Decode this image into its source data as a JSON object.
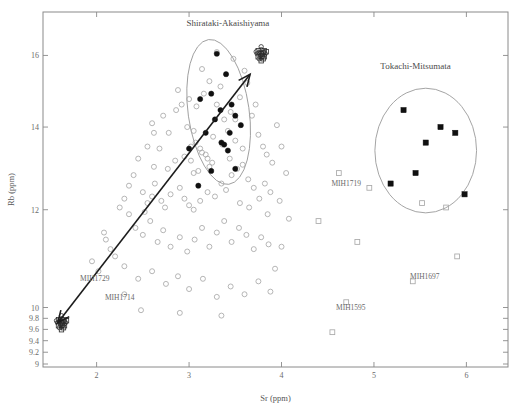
{
  "chart_data": {
    "type": "scatter",
    "title": "",
    "xlabel": "Sr (ppm)",
    "ylabel": "Rb (ppm)",
    "xlim": [
      1.42,
      6.45
    ],
    "ylim": [
      8.95,
      17.35
    ],
    "xticks": [
      "2",
      "3",
      "4",
      "5",
      "6"
    ],
    "xtick_values": [
      2,
      3,
      4,
      5,
      6
    ],
    "yticks": [
      "16",
      "14",
      "12",
      "10",
      "9.8",
      "9.6",
      "9.4",
      "9.2",
      "9"
    ],
    "ytick_values": [
      16,
      14,
      12,
      10,
      9.8,
      9.6,
      9.4,
      9.2,
      9
    ],
    "y_scale": "log",
    "grid": false,
    "legend": false,
    "annotations": [
      {
        "text": "Shirataki-Akaishiyama",
        "x": 3.42,
        "y": 16.9
      },
      {
        "text": "Tokachi-Mitsumata",
        "x": 5.45,
        "y": 15.6
      },
      {
        "text": "MIH1719",
        "x": 4.7,
        "y": 12.55
      },
      {
        "text": "MIH1697",
        "x": 5.55,
        "y": 10.55
      },
      {
        "text": "MIH1595",
        "x": 4.75,
        "y": 9.95
      },
      {
        "text": "MIH1729",
        "x": 1.98,
        "y": 10.5
      },
      {
        "text": "MIH1714",
        "x": 2.25,
        "y": 10.15
      }
    ],
    "series": [
      {
        "name": "open-circles",
        "marker": "open-circle",
        "color": "#a9a9a9",
        "points": [
          [
            2.62,
            13.85
          ],
          [
            2.78,
            13.85
          ],
          [
            2.77,
            12.95
          ],
          [
            2.62,
            13.0
          ],
          [
            2.63,
            12.6
          ],
          [
            2.98,
            14.0
          ],
          [
            3.02,
            13.5
          ],
          [
            3.07,
            13.6
          ],
          [
            3.12,
            13.45
          ],
          [
            3.14,
            13.35
          ],
          [
            3.18,
            13.3
          ],
          [
            3.2,
            13.2
          ],
          [
            3.05,
            12.85
          ],
          [
            3.1,
            12.9
          ],
          [
            3.22,
            13.0
          ],
          [
            3.25,
            13.1
          ],
          [
            2.86,
            14.45
          ],
          [
            2.92,
            14.6
          ],
          [
            2.88,
            15.0
          ],
          [
            3.0,
            14.75
          ],
          [
            3.08,
            14.55
          ],
          [
            3.16,
            14.9
          ],
          [
            3.22,
            15.25
          ],
          [
            3.3,
            14.6
          ],
          [
            3.34,
            15.1
          ],
          [
            3.38,
            14.2
          ],
          [
            3.45,
            14.4
          ],
          [
            3.5,
            14.2
          ],
          [
            3.55,
            14.8
          ],
          [
            3.6,
            15.55
          ],
          [
            3.63,
            15.2
          ],
          [
            3.68,
            14.3
          ],
          [
            3.72,
            14.6
          ],
          [
            3.75,
            13.8
          ],
          [
            3.8,
            13.5
          ],
          [
            3.84,
            13.3
          ],
          [
            3.9,
            13.1
          ],
          [
            2.5,
            12.4
          ],
          [
            2.55,
            12.15
          ],
          [
            2.6,
            12.3
          ],
          [
            2.7,
            12.2
          ],
          [
            2.74,
            12.05
          ],
          [
            2.8,
            12.35
          ],
          [
            2.9,
            12.5
          ],
          [
            2.95,
            12.25
          ],
          [
            3.0,
            12.1
          ],
          [
            3.05,
            12.0
          ],
          [
            3.12,
            12.2
          ],
          [
            3.2,
            12.4
          ],
          [
            3.28,
            12.3
          ],
          [
            3.35,
            12.6
          ],
          [
            3.4,
            12.45
          ],
          [
            3.46,
            12.8
          ],
          [
            3.52,
            12.95
          ],
          [
            3.58,
            13.05
          ],
          [
            3.64,
            12.7
          ],
          [
            3.7,
            12.5
          ],
          [
            3.76,
            12.25
          ],
          [
            3.82,
            12.6
          ],
          [
            3.88,
            12.4
          ],
          [
            2.35,
            11.9
          ],
          [
            2.42,
            11.6
          ],
          [
            2.5,
            11.45
          ],
          [
            2.58,
            11.75
          ],
          [
            2.66,
            11.3
          ],
          [
            2.72,
            11.55
          ],
          [
            2.8,
            11.2
          ],
          [
            2.9,
            11.4
          ],
          [
            2.98,
            11.1
          ],
          [
            3.06,
            11.35
          ],
          [
            3.14,
            11.6
          ],
          [
            3.22,
            11.2
          ],
          [
            3.3,
            11.5
          ],
          [
            3.38,
            11.75
          ],
          [
            3.46,
            11.3
          ],
          [
            3.54,
            11.6
          ],
          [
            3.62,
            11.45
          ],
          [
            3.7,
            11.15
          ],
          [
            3.78,
            11.4
          ],
          [
            3.86,
            11.25
          ],
          [
            2.2,
            11.0
          ],
          [
            2.3,
            10.8
          ],
          [
            2.45,
            10.55
          ],
          [
            2.6,
            10.7
          ],
          [
            2.75,
            10.45
          ],
          [
            2.88,
            10.6
          ],
          [
            3.0,
            10.35
          ],
          [
            3.15,
            10.55
          ],
          [
            3.3,
            10.2
          ],
          [
            3.45,
            10.4
          ],
          [
            3.6,
            10.25
          ],
          [
            3.75,
            10.5
          ],
          [
            3.88,
            10.3
          ],
          [
            2.1,
            11.35
          ],
          [
            2.15,
            11.15
          ],
          [
            1.95,
            10.9
          ],
          [
            2.02,
            10.7
          ],
          [
            2.08,
            11.5
          ],
          [
            2.25,
            12.05
          ],
          [
            2.3,
            12.25
          ],
          [
            3.95,
            14.05
          ],
          [
            4.0,
            13.5
          ],
          [
            4.05,
            12.85
          ],
          [
            3.98,
            12.2
          ],
          [
            4.08,
            11.8
          ],
          [
            4.0,
            11.2
          ],
          [
            3.93,
            10.75
          ],
          [
            2.55,
            13.5
          ],
          [
            2.45,
            13.2
          ],
          [
            2.4,
            12.8
          ],
          [
            2.35,
            12.55
          ],
          [
            2.6,
            14.1
          ],
          [
            2.72,
            14.3
          ],
          [
            2.68,
            13.45
          ],
          [
            2.52,
            11.95
          ],
          [
            2.3,
            10.25
          ],
          [
            2.48,
            9.95
          ],
          [
            2.9,
            9.9
          ],
          [
            3.35,
            9.85
          ],
          [
            3.05,
            13.9
          ],
          [
            3.42,
            13.9
          ],
          [
            3.5,
            13.65
          ],
          [
            3.58,
            13.45
          ],
          [
            3.3,
            16.1
          ],
          [
            3.14,
            15.6
          ],
          [
            3.48,
            15.9
          ],
          [
            3.26,
            13.75
          ],
          [
            3.36,
            13.55
          ],
          [
            3.44,
            13.2
          ],
          [
            3.55,
            12.15
          ],
          [
            3.65,
            12.05
          ],
          [
            3.85,
            11.9
          ],
          [
            2.85,
            13.15
          ],
          [
            2.95,
            13.25
          ],
          [
            3.02,
            13.15
          ]
        ]
      },
      {
        "name": "filled-circles-shirataki",
        "marker": "filled-circle",
        "color": "#101010",
        "points": [
          [
            3.3,
            16.05
          ],
          [
            3.4,
            15.45
          ],
          [
            3.12,
            14.75
          ],
          [
            3.24,
            14.9
          ],
          [
            3.46,
            14.6
          ],
          [
            3.5,
            14.3
          ],
          [
            3.56,
            14.05
          ],
          [
            3.28,
            14.2
          ],
          [
            3.18,
            13.85
          ],
          [
            3.35,
            13.6
          ],
          [
            3.38,
            13.55
          ],
          [
            3.42,
            13.4
          ],
          [
            3.5,
            12.95
          ],
          [
            3.24,
            12.9
          ],
          [
            3.1,
            12.55
          ],
          [
            3.0,
            13.45
          ],
          [
            3.34,
            14.45
          ],
          [
            3.44,
            13.85
          ]
        ]
      },
      {
        "name": "filled-squares-tokachi",
        "marker": "filled-square",
        "color": "#101010",
        "points": [
          [
            5.32,
            14.45
          ],
          [
            5.72,
            14.0
          ],
          [
            5.88,
            13.85
          ],
          [
            5.56,
            13.6
          ],
          [
            5.18,
            12.6
          ],
          [
            5.45,
            12.85
          ],
          [
            5.98,
            12.35
          ]
        ]
      },
      {
        "name": "open-squares",
        "marker": "open-square",
        "color": "#9a9a9a",
        "points": [
          [
            4.62,
            12.85
          ],
          [
            4.95,
            12.5
          ],
          [
            5.52,
            12.15
          ],
          [
            5.78,
            12.05
          ],
          [
            4.82,
            11.3
          ],
          [
            5.42,
            10.5
          ],
          [
            4.7,
            10.1
          ],
          [
            4.55,
            9.55
          ],
          [
            4.4,
            11.75
          ],
          [
            5.9,
            11.0
          ]
        ]
      }
    ],
    "ellipses": [
      {
        "name": "Shirataki-Akaishiyama",
        "cx": 3.32,
        "cy": 14.4,
        "rx": 0.33,
        "ry": 1.95,
        "rotation": -8
      },
      {
        "name": "Tokachi-Mitsumata",
        "cx": 5.56,
        "cy": 13.4,
        "rx": 0.55,
        "ry": 1.55,
        "rotation": 0
      }
    ],
    "arrow": {
      "from_x": 3.66,
      "from_y": 15.45,
      "to_x": 1.58,
      "to_y": 9.72,
      "description": "double-headed arrow connecting dense source cluster to artifact cluster"
    },
    "clusters": [
      {
        "name": "upper-cluster-glyph",
        "x": 3.78,
        "y": 16.05
      },
      {
        "name": "lower-cluster-glyph",
        "x": 1.62,
        "y": 9.72
      }
    ]
  },
  "figure": {
    "caption": ""
  }
}
